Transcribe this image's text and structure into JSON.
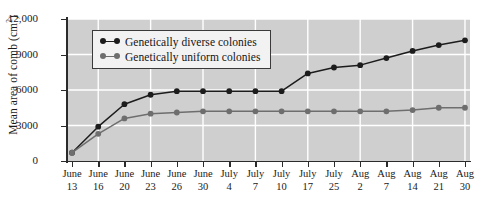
{
  "chart_data": {
    "type": "line",
    "title": "",
    "xlabel": "",
    "ylabel": "Mean area of comb (cm2)",
    "ylabel_base": "Mean area of comb (cm",
    "ylabel_sup": "2",
    "ylabel_close": ")",
    "ylim": [
      0,
      12000
    ],
    "yticks": [
      0,
      3000,
      6000,
      9000,
      12000
    ],
    "ytick_labels": [
      "0",
      "3000",
      "6000",
      "9000",
      "12,000"
    ],
    "grid": true,
    "grid_color": "#ffffff",
    "plot_background": "#cfcfcf",
    "legend_position": "top-left-inside",
    "categories": [
      "June 13",
      "June 16",
      "June 20",
      "June 23",
      "June 26",
      "June 30",
      "July 4",
      "July 7",
      "July 10",
      "July 17",
      "July 25",
      "Aug 2",
      "Aug 7",
      "Aug 14",
      "Aug 21",
      "Aug 30"
    ],
    "xtick_months": [
      "June",
      "June",
      "June",
      "June",
      "June",
      "June",
      "July",
      "July",
      "July",
      "July",
      "July",
      "Aug",
      "Aug",
      "Aug",
      "Aug",
      "Aug"
    ],
    "xtick_days": [
      "13",
      "16",
      "20",
      "23",
      "26",
      "30",
      "4",
      "7",
      "10",
      "17",
      "25",
      "2",
      "7",
      "14",
      "21",
      "30"
    ],
    "series": [
      {
        "name": "Genetically diverse colonies",
        "color": "#1c1c1c",
        "marker": "circle",
        "values": [
          700,
          2900,
          4800,
          5600,
          5900,
          5900,
          5900,
          5900,
          5900,
          7400,
          7900,
          8100,
          8700,
          9300,
          9800,
          10200
        ]
      },
      {
        "name": "Genetically uniform colonies",
        "color": "#6e6e6e",
        "marker": "circle",
        "values": [
          700,
          2300,
          3600,
          4000,
          4100,
          4200,
          4200,
          4200,
          4200,
          4200,
          4200,
          4200,
          4200,
          4300,
          4500,
          4500
        ]
      }
    ]
  },
  "legend": {
    "items": [
      {
        "label": "Genetically diverse colonies",
        "color": "#1c1c1c"
      },
      {
        "label": "Genetically uniform colonies",
        "color": "#6e6e6e"
      }
    ]
  }
}
